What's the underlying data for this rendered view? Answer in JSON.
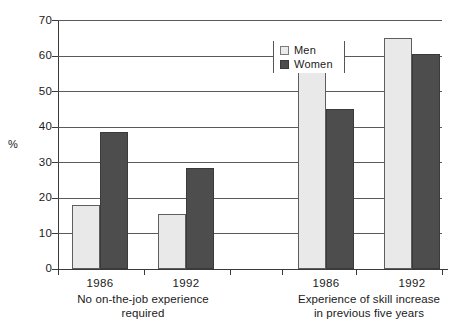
{
  "chart_data": {
    "type": "bar",
    "title": "",
    "xlabel": "",
    "ylabel": "%",
    "ylim": [
      0,
      70
    ],
    "yticks": [
      0,
      10,
      20,
      30,
      40,
      50,
      60,
      70
    ],
    "grid": true,
    "legend_position": "top-center",
    "categories": [
      "1986",
      "1992",
      "1986",
      "1992"
    ],
    "groups": [
      {
        "caption": "No on-the-job experience required",
        "caption_line1": "No on-the-job experience",
        "caption_line2": "required",
        "years": [
          "1986",
          "1992"
        ]
      },
      {
        "caption": "Experience of skill increase in previous five years",
        "caption_line1": "Experience of skill increase",
        "caption_line2": "in previous five years",
        "years": [
          "1986",
          "1992"
        ]
      }
    ],
    "series": [
      {
        "name": "Men",
        "color": "#e9e9e9",
        "values": [
          18,
          15.5,
          57,
          65
        ]
      },
      {
        "name": "Women",
        "color": "#4d4d4d",
        "values": [
          38.5,
          28.5,
          45,
          60.5
        ]
      }
    ]
  },
  "legend": {
    "items": [
      {
        "label": "Men",
        "swatch": "men"
      },
      {
        "label": "Women",
        "swatch": "women"
      }
    ]
  },
  "axis": {
    "y_title": "%",
    "tick_70": "70",
    "tick_60": "60",
    "tick_50": "50",
    "tick_40": "40",
    "tick_30": "30",
    "tick_20": "20",
    "tick_10": "10",
    "tick_0": "0"
  }
}
